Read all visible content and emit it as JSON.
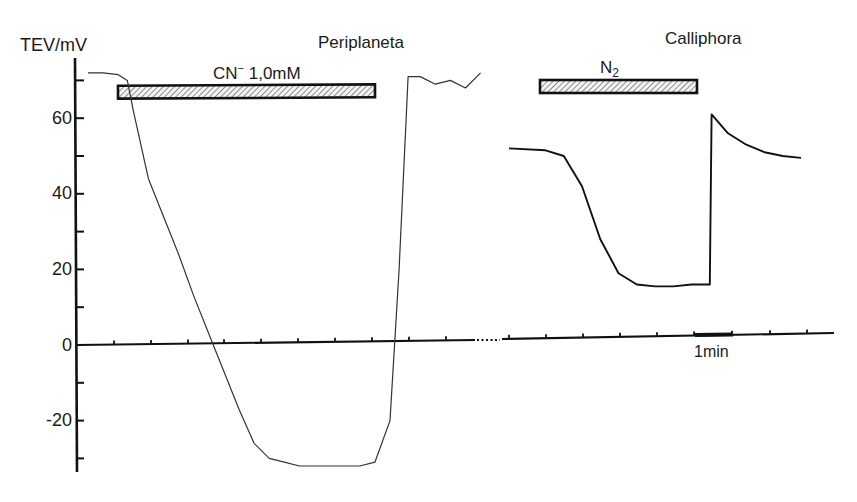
{
  "chart_data": {
    "type": "line",
    "title": "",
    "ylabel": "TEV/mV",
    "xlabel": "",
    "ylim": [
      -33,
      73
    ],
    "y_ticks_major": [
      60,
      40,
      20,
      0,
      -20
    ],
    "y_ticks_minor": [
      70,
      50,
      30,
      10,
      -10,
      -30
    ],
    "x_axis_break": true,
    "x_tick_spacing_note": "tick marks at regular time intervals",
    "scale_bar": {
      "label": "1min"
    },
    "panels": [
      {
        "name": "Periplaneta",
        "treatment": {
          "label": "CN⁻ 1,0mM",
          "ion": "CN",
          "charge": "−",
          "concentration": "1,0mM"
        },
        "series": [
          {
            "name": "Periplaneta TEV",
            "x_min": [
              0,
              0.5,
              1.0,
              1.3,
              1.5,
              2.0,
              2.5,
              3.0,
              3.5,
              4.0,
              4.5,
              5.0,
              5.5,
              6.0,
              6.5,
              7.0,
              7.5,
              8.0,
              8.5,
              9.0,
              9.5,
              10.0,
              10.3,
              10.6,
              11.0,
              11.5,
              12.0,
              12.5,
              13.0
            ],
            "tev_mV": [
              72,
              72,
              71.5,
              70,
              62,
              44,
              34,
              24,
              13,
              3,
              -7,
              -17,
              -26,
              -30,
              -31,
              -32,
              -32,
              -32,
              -32,
              -32,
              -31,
              -20,
              20,
              71,
              71,
              69,
              70,
              68,
              72
            ]
          }
        ]
      },
      {
        "name": "Calliphora",
        "treatment": {
          "label": "N2",
          "gas": "N",
          "subscript": "2"
        },
        "series": [
          {
            "name": "Calliphora TEV",
            "x_min": [
              0,
              1,
              1.5,
              2.0,
              2.5,
              3.0,
              3.5,
              4.0,
              4.5,
              5.0,
              5.5,
              5.55,
              6.0,
              6.5,
              7.0,
              7.5,
              8.0
            ],
            "tev_mV": [
              52,
              51.5,
              50,
              42,
              28,
              19,
              16,
              15.5,
              15.5,
              16,
              16,
              61,
              56,
              53,
              51,
              50,
              49.5
            ]
          }
        ]
      }
    ]
  },
  "labels": {
    "y_axis_title": "TEV/mV",
    "panel_left_title": "Periplaneta",
    "panel_right_title": "Calliphora",
    "cn_bar": {
      "main": "CN",
      "sup": "−",
      "rest": " 1,0mM"
    },
    "n2_bar": {
      "main": "N",
      "sub": "2"
    },
    "y_tick_labels": [
      "60",
      "40",
      "20",
      "0",
      "-20"
    ],
    "scale_bar_label": "1min"
  }
}
